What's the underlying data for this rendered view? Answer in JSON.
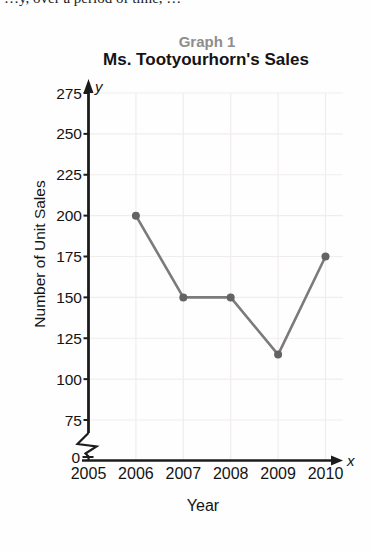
{
  "page": {
    "background": "#fefefe",
    "top_text_fragment": "…y, over a period of time, …"
  },
  "chart_data": {
    "type": "line",
    "graph_label": "Graph 1",
    "title": "Ms. Tootyourhorn's Sales",
    "xlabel": "Year",
    "ylabel": "Number of Unit Sales",
    "x_axis_letter": "x",
    "y_axis_letter": "y",
    "x": [
      2006,
      2007,
      2008,
      2009,
      2010
    ],
    "values": [
      200,
      150,
      150,
      115,
      175
    ],
    "x_ticks": [
      2005,
      2006,
      2007,
      2008,
      2009,
      2010
    ],
    "y_ticks": [
      0,
      75,
      100,
      125,
      150,
      175,
      200,
      225,
      250,
      275
    ],
    "y_axis_break": true,
    "ylim": [
      0,
      287
    ],
    "xlim": [
      2005,
      2010.4
    ],
    "grid": true,
    "legend": false,
    "colors": {
      "line": "#7b7b7b",
      "point": "#636363",
      "grid": "#f1edeb",
      "axis": "#1c1c1c",
      "text": "#141414",
      "graph_label": "#8d8d8d"
    }
  }
}
